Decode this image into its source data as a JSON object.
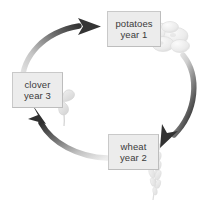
{
  "diagram": {
    "background_color": "#ffffff",
    "box_fill_color": "#ececec",
    "box_border_color": "#c9c9c9",
    "text_color": "#3b3b3b",
    "arrow_dark_color": "#3a3a3a",
    "arrow_light_color": "#e2e2e2",
    "illustration_color": "#e3e3e3"
  },
  "nodes": [
    {
      "id": "potatoes",
      "crop": "potatoes",
      "year_label": "year 1",
      "icon": "potatoes-icon"
    },
    {
      "id": "wheat",
      "crop": "wheat",
      "year_label": "year 2",
      "icon": "wheat-stalk-icon"
    },
    {
      "id": "clover",
      "crop": "clover",
      "year_label": "year 3",
      "icon": "clover-icon"
    }
  ],
  "arrows": [
    {
      "id": "clover-to-potatoes",
      "from": "clover",
      "to": "potatoes",
      "name": "arrow-clover-to-potatoes"
    },
    {
      "id": "potatoes-to-wheat",
      "from": "potatoes",
      "to": "wheat",
      "name": "arrow-potatoes-to-wheat"
    },
    {
      "id": "wheat-to-clover",
      "from": "wheat",
      "to": "clover",
      "name": "arrow-wheat-to-clover"
    }
  ]
}
